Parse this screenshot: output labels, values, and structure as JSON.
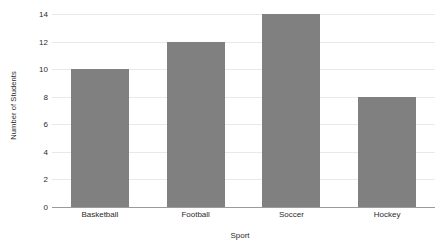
{
  "chart_data": {
    "type": "bar",
    "title": "",
    "subtitle": "",
    "xlabel": "Sport",
    "ylabel": "Number of Students",
    "categories": [
      "Basketball",
      "Football",
      "Soccer",
      "Hockey"
    ],
    "values": [
      10,
      12,
      14,
      8
    ],
    "series": [
      {
        "name": "Number of Students",
        "values": [
          10,
          12,
          14,
          8
        ]
      }
    ],
    "ylim": [
      0,
      14
    ],
    "xlim": [
      0,
      4
    ],
    "ytick_labels": [
      "0",
      "2",
      "4",
      "6",
      "8",
      "10",
      "12",
      "14"
    ],
    "ytick_values": [
      0,
      2,
      4,
      6,
      8,
      10,
      12,
      14
    ],
    "ytick_step": 2,
    "grid": {
      "horizontal": true,
      "vertical": false,
      "color": "#e9e9e9"
    },
    "legend": {
      "visible": false,
      "position": "none",
      "entries": []
    },
    "annotations": [],
    "data_labels": false,
    "orientation": "vertical",
    "bar_color": "#808080",
    "background_color": "#ffffff",
    "axis_line_color": "#9b9b9b",
    "text_color": "#2b2b2b",
    "spines": {
      "top": false,
      "right": false,
      "left": false,
      "bottom": true
    }
  }
}
